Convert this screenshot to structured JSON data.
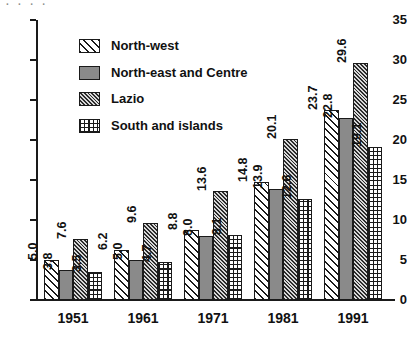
{
  "artifact": {
    "top_fragment_text": "· · · ·"
  },
  "chart_data": {
    "type": "bar",
    "title": "",
    "subtitle": "",
    "xlabel": "",
    "ylabel": "",
    "categories": [
      "1951",
      "1961",
      "1971",
      "1981",
      "1991"
    ],
    "ylim": [
      0,
      35
    ],
    "yticks": [
      0,
      5,
      10,
      15,
      20,
      25,
      30,
      35
    ],
    "ytick_labels": [
      "0",
      "5",
      "10",
      "15",
      "20",
      "25",
      "30",
      "35"
    ],
    "grid": false,
    "legend_position": "inside upper-left",
    "series": [
      {
        "name": "North-west",
        "pattern": "diagonal-stripes",
        "values": [
          5.0,
          6.2,
          8.8,
          14.8,
          23.7
        ],
        "labels": [
          "5.0",
          "6.2",
          "8.8",
          "14.8",
          "23.7"
        ]
      },
      {
        "name": "North-east and Centre",
        "pattern": "solid-gray",
        "values": [
          3.8,
          5.0,
          8.0,
          13.9,
          22.8
        ],
        "labels": [
          "3.8",
          "5.0",
          "8.0",
          "13.9",
          "22.8"
        ]
      },
      {
        "name": "Lazio",
        "pattern": "dense-diagonal-hatch",
        "values": [
          7.6,
          9.6,
          13.6,
          20.1,
          29.6
        ],
        "labels": [
          "7.6",
          "9.6",
          "13.6",
          "20.1",
          "29.6"
        ]
      },
      {
        "name": "South and islands",
        "pattern": "cross-hatch-grid",
        "values": [
          3.5,
          4.7,
          8.1,
          12.6,
          19.1
        ],
        "labels": [
          "3.5",
          "4.7",
          "8.1",
          "12.6",
          "19.1"
        ]
      }
    ]
  },
  "colors": {
    "axis": "#1a1a1a",
    "text": "#111111",
    "series_fill_solid": "#8a8a8a",
    "background": "#ffffff"
  }
}
